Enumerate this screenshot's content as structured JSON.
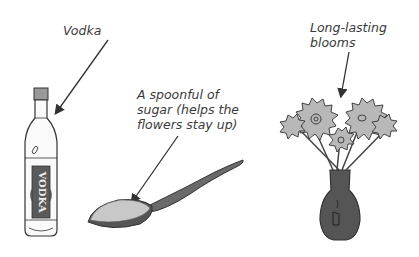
{
  "labels": {
    "vodka": "Vodka",
    "sugar_line1": "A spoonful of",
    "sugar_line2": "sugar (helps the",
    "sugar_line3": "flowers stay up)",
    "blooms_line1": "Long-lasting",
    "blooms_line2": "blooms"
  },
  "bottle_text": "VODKA",
  "colors": {
    "outline": "#333333",
    "vase": "#555555",
    "petal": "#b8b8b8",
    "label_band": "#5a5a5a",
    "sugar": "#c8c8c8"
  }
}
